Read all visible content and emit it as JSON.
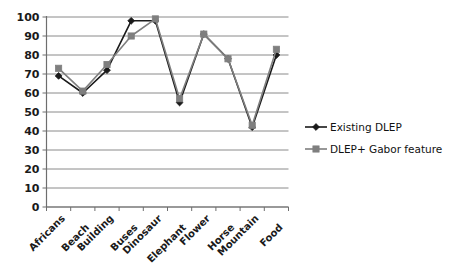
{
  "chart_data": {
    "type": "line",
    "title": "",
    "subtitle": "",
    "xlabel": "",
    "ylabel": "",
    "ylim": [
      0,
      100
    ],
    "ytick_values": [
      0,
      10,
      20,
      30,
      40,
      50,
      60,
      70,
      80,
      90,
      100
    ],
    "ytick_labels": [
      "0",
      "10",
      "20",
      "30",
      "40",
      "50",
      "60",
      "70",
      "80",
      "90",
      "100"
    ],
    "grid": true,
    "grid_axis": "y",
    "legend_position": "right",
    "categories": [
      "Africans",
      "Beach",
      "Building",
      "Buses",
      "Dinosaur",
      "Elephant",
      "Flower",
      "Horse",
      "Mountain",
      "Food"
    ],
    "series": [
      {
        "name": "Existing DLEP",
        "color": "#1a1a1a",
        "marker": "diamond",
        "values": [
          69,
          60,
          72,
          98,
          98,
          55,
          91,
          78,
          42,
          80
        ]
      },
      {
        "name": "DLEP+ Gabor feature",
        "color": "#7f7f7f",
        "marker": "square",
        "values": [
          73,
          61,
          75,
          90,
          99,
          57,
          91,
          78,
          43,
          83
        ]
      }
    ]
  },
  "legend": {
    "entries": [
      {
        "label": "Existing DLEP",
        "marker": "diamond-marker-icon",
        "color": "#1a1a1a"
      },
      {
        "label": "DLEP+ Gabor feature",
        "marker": "square-marker-icon",
        "color": "#7f7f7f"
      }
    ]
  },
  "colors": {
    "series_existing": "#1a1a1a",
    "series_gabor": "#7f7f7f",
    "gridline": "#8a8a8a",
    "axis": "#6e6e6e",
    "background": "#ffffff",
    "text": "#1a1a1a"
  }
}
